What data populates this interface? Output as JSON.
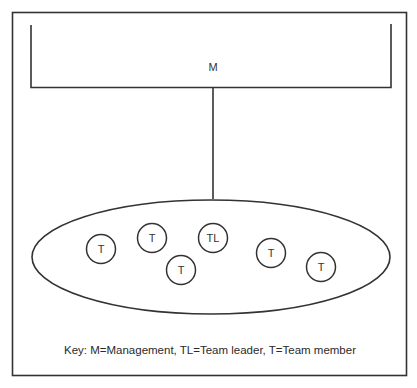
{
  "diagram": {
    "management": {
      "label": "M"
    },
    "team": {
      "nodes": [
        {
          "label": "T",
          "cx": 101,
          "cy": 249
        },
        {
          "label": "T",
          "cx": 152,
          "cy": 238
        },
        {
          "label": "T",
          "cx": 181,
          "cy": 270
        },
        {
          "label": "TL",
          "cx": 213,
          "cy": 238
        },
        {
          "label": "T",
          "cx": 271,
          "cy": 253
        },
        {
          "label": "T",
          "cx": 321,
          "cy": 267
        }
      ]
    },
    "key": "Key: M=Management, TL=Team leader, T=Team member"
  }
}
